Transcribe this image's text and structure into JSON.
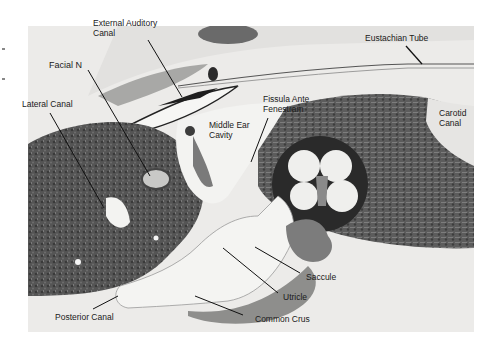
{
  "figure": {
    "labels": [
      {
        "id": "external-auditory-canal",
        "line1": "External Auditory",
        "line2": "Canal"
      },
      {
        "id": "facial-n",
        "line1": "Facial N",
        "line2": ""
      },
      {
        "id": "lateral-canal",
        "line1": "Lateral Canal",
        "line2": ""
      },
      {
        "id": "middle-ear-cavity",
        "line1": "Middle Ear",
        "line2": "Cavity"
      },
      {
        "id": "fissula-ante-fenestram",
        "line1": "Fissula Ante",
        "line2": "Fenestram"
      },
      {
        "id": "eustachian-tube",
        "line1": "Eustachian Tube",
        "line2": ""
      },
      {
        "id": "carotid-canal",
        "line1": "Carotid",
        "line2": "Canal"
      },
      {
        "id": "saccule",
        "line1": "Saccule",
        "line2": ""
      },
      {
        "id": "utricle",
        "line1": "Utricle",
        "line2": ""
      },
      {
        "id": "common-crus",
        "line1": "Common Crus",
        "line2": ""
      },
      {
        "id": "posterior-canal",
        "line1": "Posterior Canal",
        "line2": ""
      }
    ],
    "colors": {
      "background": "#ffffff",
      "section_light": "#ecebe9",
      "bone_dark": "#4a4a4a",
      "cavity": "#f4f4f2",
      "label_text": "#1a1a1a",
      "pointer": "#111111"
    }
  }
}
